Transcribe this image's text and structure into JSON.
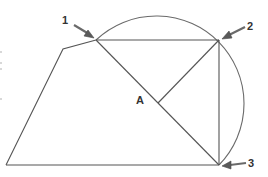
{
  "diagram": {
    "title": "",
    "labels": {
      "point1": "1",
      "point2": "2",
      "point3": "3",
      "pointA": "A"
    },
    "points": {
      "p1": [
        96,
        40
      ],
      "p2": [
        219,
        40
      ],
      "p3": [
        219,
        165
      ],
      "bottom_left": [
        6,
        165
      ],
      "upper_left": [
        63,
        49
      ],
      "A": [
        158,
        103
      ]
    },
    "arc": {
      "center": [
        157.5,
        102.5
      ],
      "radius": 87.7,
      "from": "point1",
      "to": "point3",
      "through": "point2"
    },
    "colors": {
      "line": "#555555",
      "arc": "#6a6a6a",
      "label": "#333333",
      "arrow": "#5a5a5a"
    }
  }
}
